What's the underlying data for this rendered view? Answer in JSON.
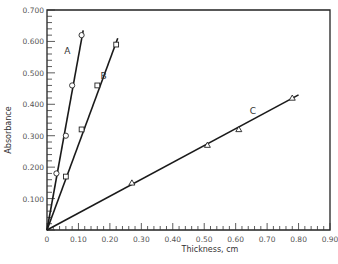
{
  "chart_data": {
    "type": "line",
    "title": "",
    "xlabel": "Thickness,   cm",
    "ylabel": "Absorbance",
    "xlim": [
      0,
      0.9
    ],
    "ylim": [
      0,
      0.7
    ],
    "grid": false,
    "legend": "inline labels A, B, C next to lines",
    "x_ticks": [
      "0",
      "0.10",
      "0.20",
      "0.30",
      "0.40",
      "0.50",
      "0.60",
      "0.70",
      "0.80",
      "0.90"
    ],
    "y_ticks": [
      "0.100",
      "0.200",
      "0.300",
      "0.400",
      "0.500",
      "0.600",
      "0.700"
    ],
    "series": [
      {
        "name": "A",
        "marker": "circle",
        "points": [
          [
            0.03,
            0.18
          ],
          [
            0.06,
            0.3
          ],
          [
            0.08,
            0.46
          ],
          [
            0.11,
            0.62
          ]
        ],
        "fit_line": [
          [
            0,
            0
          ],
          [
            0.115,
            0.635
          ]
        ],
        "label_pos": [
          0.065,
          0.56
        ]
      },
      {
        "name": "B",
        "marker": "square",
        "points": [
          [
            0.06,
            0.17
          ],
          [
            0.11,
            0.32
          ],
          [
            0.16,
            0.46
          ],
          [
            0.22,
            0.59
          ]
        ],
        "fit_line": [
          [
            0,
            0
          ],
          [
            0.225,
            0.61
          ]
        ],
        "label_pos": [
          0.18,
          0.48
        ]
      },
      {
        "name": "C",
        "marker": "triangle",
        "points": [
          [
            0.27,
            0.15
          ],
          [
            0.51,
            0.27
          ],
          [
            0.61,
            0.32
          ],
          [
            0.78,
            0.42
          ]
        ],
        "fit_line": [
          [
            0,
            0
          ],
          [
            0.8,
            0.43
          ]
        ],
        "label_pos": [
          0.655,
          0.37
        ]
      }
    ]
  }
}
